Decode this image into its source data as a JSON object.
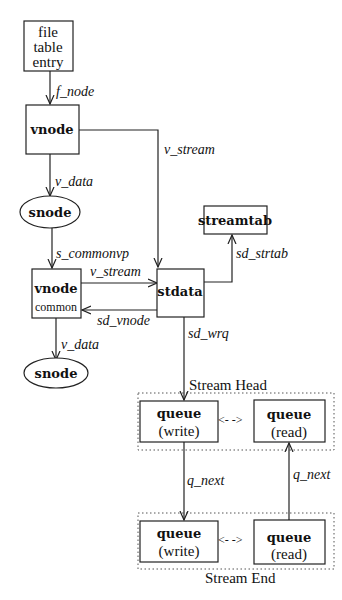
{
  "nodes": {
    "file_table_entry": [
      "file",
      "table",
      "entry"
    ],
    "vnode": "vnode",
    "snode_top": "snode",
    "vnode_common": {
      "title": "vnode",
      "sub": "common"
    },
    "snode_bottom": "snode",
    "stdata": "stdata",
    "streamtab": "streamtab",
    "queue_head_write": {
      "title": "queue",
      "sub": "(write)"
    },
    "queue_head_read": {
      "title": "queue",
      "sub": "(read)"
    },
    "queue_end_write": {
      "title": "queue",
      "sub": "(write)"
    },
    "queue_end_read": {
      "title": "queue",
      "sub": "(read)"
    }
  },
  "groups": {
    "stream_head": "Stream Head",
    "stream_end": "Stream End"
  },
  "edges": {
    "f_node": "f_node",
    "v_stream_top": "v_stream",
    "v_data_top": "v_data",
    "s_commonvp": "s_commonvp",
    "v_stream_mid": "v_stream",
    "sd_vnode": "sd_vnode",
    "sd_strtab": "sd_strtab",
    "v_data_bottom": "v_data",
    "sd_wrq": "sd_wrq",
    "q_next_down": "q_next",
    "q_next_up": "q_next",
    "head_link": "<- ->",
    "end_link": "<- ->"
  }
}
